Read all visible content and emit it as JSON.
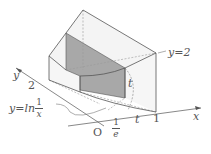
{
  "diagram": {
    "type": "3d-solid-cross-section",
    "labels": {
      "y_axis": "y",
      "x_axis": "x",
      "origin": "O",
      "y_tick_2": "2",
      "x_tick_1": "1",
      "x_tick_t": "t",
      "x_tick_1_over_e_num": "1",
      "x_tick_1_over_e_den": "e",
      "plane_label": "y=2",
      "curve_label_prefix": "y=ln",
      "curve_label_num": "1",
      "curve_label_den": "x",
      "height_label": "t"
    },
    "colors": {
      "line": "#555555",
      "dashed": "#888888",
      "face_light": "#f2f2f2",
      "face_shaded": "#a8a8a8"
    }
  }
}
